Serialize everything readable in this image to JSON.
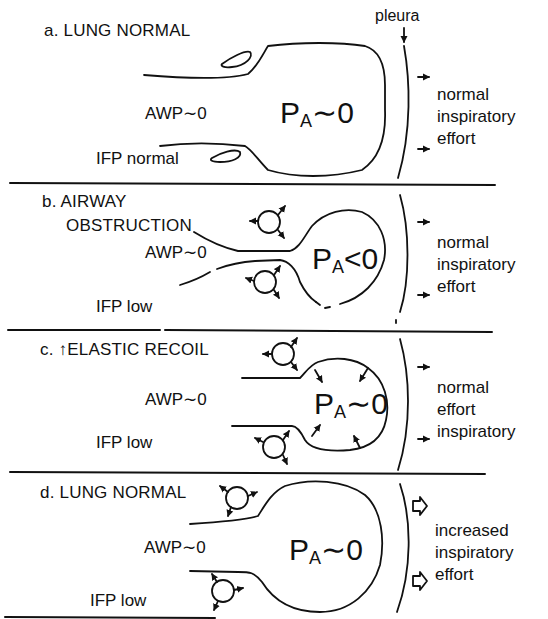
{
  "figure": {
    "pleura_label": "pleura",
    "panels": [
      {
        "id": "a",
        "title": "a. LUNG NORMAL",
        "airway_pressure": "AWP∼0",
        "interstitial_fluid_pressure": "IFP normal",
        "alveolar_pressure_symbol": "P",
        "alveolar_pressure_subscript": "A",
        "alveolar_pressure_relation": "∼0",
        "effort_lines": [
          "normal",
          "inspiratory",
          "effort"
        ],
        "arrow_style": "small-solid"
      },
      {
        "id": "b",
        "title_line1": "b. AIRWAY",
        "title_line2": "OBSTRUCTION",
        "airway_pressure": "AWP∼0",
        "interstitial_fluid_pressure": "IFP low",
        "alveolar_pressure_symbol": "P",
        "alveolar_pressure_subscript": "A",
        "alveolar_pressure_relation": "<0",
        "effort_lines": [
          "normal",
          "inspiratory",
          "effort"
        ],
        "arrow_style": "small-solid"
      },
      {
        "id": "c",
        "title": "c. ↑ELASTIC RECOIL",
        "airway_pressure": "AWP∼0",
        "interstitial_fluid_pressure": "IFP low",
        "alveolar_pressure_symbol": "P",
        "alveolar_pressure_subscript": "A",
        "alveolar_pressure_relation": "∼0",
        "effort_lines": [
          "normal",
          "effort",
          "inspiratory"
        ],
        "arrow_style": "small-solid"
      },
      {
        "id": "d",
        "title": "d. LUNG NORMAL",
        "airway_pressure": "AWP∼0",
        "interstitial_fluid_pressure": "IFP low",
        "alveolar_pressure_symbol": "P",
        "alveolar_pressure_subscript": "A",
        "alveolar_pressure_relation": "∼0",
        "effort_lines": [
          "increased",
          "inspiratory",
          "effort"
        ],
        "arrow_style": "large-outline"
      }
    ]
  },
  "colors": {
    "ink": "#111111",
    "background": "#ffffff"
  }
}
